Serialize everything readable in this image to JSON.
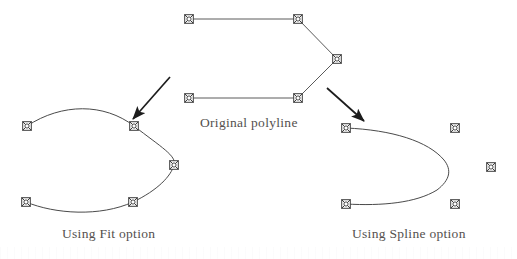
{
  "figure": {
    "background_color": "#ffffff",
    "line_color": "#4a4a4a",
    "marker_color": "#3c3c3c",
    "text_color": "#54504e",
    "arrow_color": "#1c1c1c"
  },
  "captions": {
    "original": "Original polyline",
    "fit": "Using Fit option",
    "spline": "Using Spline option"
  },
  "shapes": {
    "original_polyline": {
      "name": "original-polyline",
      "type": "polyline",
      "closed": false,
      "vertices": [
        {
          "x": 189,
          "y": 19
        },
        {
          "x": 298,
          "y": 19
        },
        {
          "x": 337,
          "y": 59
        },
        {
          "x": 298,
          "y": 98
        },
        {
          "x": 189,
          "y": 98
        }
      ],
      "path": "M 189 19 L 298 19 L 337 59 L 298 98 L 189 98"
    },
    "fit_curve": {
      "name": "fit-curve",
      "type": "smooth-curve-through-points",
      "description": "Curve passes through every vertex",
      "vertices": [
        {
          "x": 27,
          "y": 126
        },
        {
          "x": 134,
          "y": 126
        },
        {
          "x": 174,
          "y": 165
        },
        {
          "x": 133,
          "y": 202
        },
        {
          "x": 26,
          "y": 202
        }
      ],
      "path": "M 27 126 C 62 103, 104 103, 134 126 C 161 147, 177 156, 174 165 C 171 176, 158 190, 133 202 C 100 217, 55 214, 26 202"
    },
    "spline_curve": {
      "name": "spline-curve",
      "type": "approximating-spline",
      "description": "Curve approximates interior vertices, touches endpoints",
      "vertices": [
        {
          "x": 346,
          "y": 128
        },
        {
          "x": 455,
          "y": 128
        },
        {
          "x": 491,
          "y": 167
        },
        {
          "x": 455,
          "y": 204
        },
        {
          "x": 346,
          "y": 204
        }
      ],
      "path": "M 346 128 C 392 130, 428 141, 444 160 C 452 170, 450 180, 437 190 C 416 203, 382 206, 346 204"
    }
  },
  "arrows": [
    {
      "name": "arrow-to-fit",
      "from": {
        "x": 170,
        "y": 77
      },
      "to": {
        "x": 133,
        "y": 119
      },
      "points_to": "fit-curve"
    },
    {
      "name": "arrow-to-spline",
      "from": {
        "x": 327,
        "y": 88
      },
      "to": {
        "x": 364,
        "y": 121
      },
      "points_to": "spline-curve"
    }
  ],
  "marker": {
    "name": "crossed-square-vertex-marker",
    "glyph": "square-with-x",
    "size": 9
  }
}
